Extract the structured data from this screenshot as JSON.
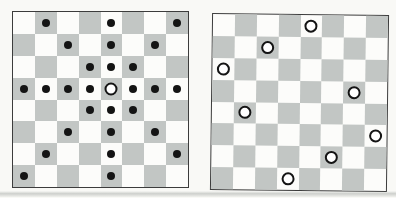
{
  "figure": {
    "board_size": 8
  },
  "colors": {
    "light_square": "#fcfcfa",
    "dark_square": "#c2c6c4",
    "board_border": "#3c3c3c",
    "dot": "#141414",
    "queen_fill": "#ffffff",
    "queen_stroke": "#141414",
    "page_background": "#f9f9f6"
  },
  "left_board": {
    "rows": 8,
    "cols": 8,
    "queen": {
      "row": 3,
      "col": 4
    },
    "dots": [
      [
        0,
        1
      ],
      [
        0,
        4
      ],
      [
        0,
        7
      ],
      [
        1,
        2
      ],
      [
        1,
        4
      ],
      [
        1,
        6
      ],
      [
        2,
        3
      ],
      [
        2,
        4
      ],
      [
        2,
        5
      ],
      [
        3,
        0
      ],
      [
        3,
        1
      ],
      [
        3,
        2
      ],
      [
        3,
        3
      ],
      [
        3,
        5
      ],
      [
        3,
        6
      ],
      [
        3,
        7
      ],
      [
        4,
        3
      ],
      [
        4,
        4
      ],
      [
        4,
        5
      ],
      [
        5,
        2
      ],
      [
        5,
        4
      ],
      [
        5,
        6
      ],
      [
        6,
        1
      ],
      [
        6,
        4
      ],
      [
        6,
        7
      ],
      [
        7,
        0
      ],
      [
        7,
        4
      ]
    ]
  },
  "right_board": {
    "rows": 8,
    "cols": 8,
    "queens": [
      [
        0,
        4
      ],
      [
        1,
        2
      ],
      [
        2,
        0
      ],
      [
        3,
        6
      ],
      [
        4,
        1
      ],
      [
        5,
        7
      ],
      [
        6,
        5
      ],
      [
        7,
        3
      ]
    ]
  }
}
